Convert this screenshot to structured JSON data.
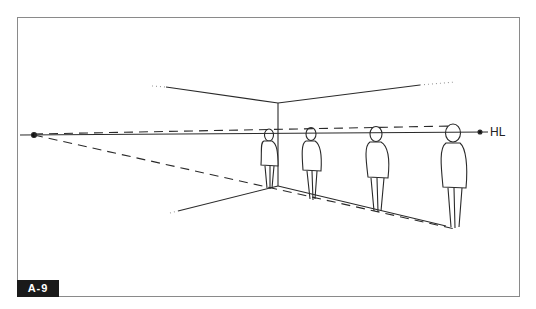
{
  "figure": {
    "badge_label": "A-9",
    "horizon_label": "HL"
  },
  "elements": {
    "vanishing_point": "vanishing-point-dot",
    "figures_count": 4
  },
  "colors": {
    "line": "#2a2a2a",
    "frame": "#8a8a8a",
    "badge_bg": "#1a1a1a",
    "badge_text": "#ffffff"
  }
}
